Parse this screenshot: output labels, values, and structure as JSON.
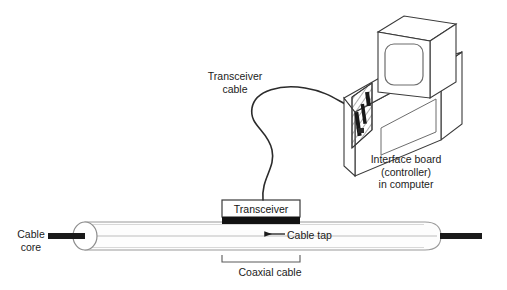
{
  "diagram": {
    "background_color": "#ffffff",
    "line_color": "#3a3a3a",
    "text_color": "#1b1b1b",
    "core_color": "#1a1a1a",
    "transceiver_band_color": "#111111",
    "cable_body_color": "#fdfdfd",
    "hatch_color": "#555555"
  },
  "labels": {
    "cable_core": "Cable\ncore",
    "transceiver_cable": "Transceiver\ncable",
    "transceiver": "Transceiver",
    "cable_tap": "Cable tap",
    "coaxial_cable": "Coaxial cable",
    "interface_board": "Interface board\n(controller)\nin computer"
  },
  "parts": {
    "coaxial_cable": {
      "name": "Coaxial cable",
      "left_end": "open cut-away ellipse",
      "right_end": "rounded cap",
      "core": "Cable core"
    },
    "transceiver": {
      "name": "Transceiver",
      "mounted_on": "Coaxial cable",
      "tap": "Cable tap"
    },
    "transceiver_cable": {
      "name": "Transceiver cable",
      "from": "Transceiver",
      "to": "Interface board"
    },
    "computer": {
      "name": "in computer",
      "monitor": "CRT monitor",
      "case": "open computer case",
      "board": "Interface board (controller)"
    }
  }
}
